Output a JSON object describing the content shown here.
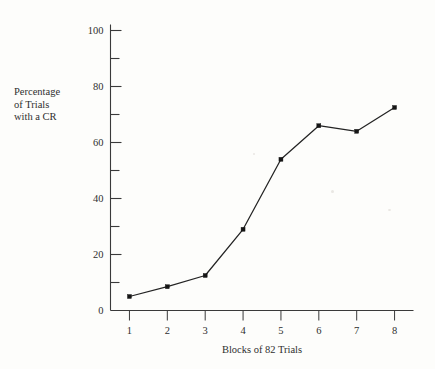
{
  "figure": {
    "background_color": "#fdfdfb",
    "line_color": "#232323",
    "axis_color": "#3a3a3a"
  },
  "ylabel_lines": [
    "Percentage",
    "of Trials",
    "with a CR"
  ],
  "chart_data": {
    "type": "line",
    "title": "",
    "xlabel": "Blocks of 82 Trials",
    "ylabel": "Percentage of Trials with a CR",
    "categories": [
      "1",
      "2",
      "3",
      "4",
      "5",
      "6",
      "7",
      "8"
    ],
    "x": [
      1,
      2,
      3,
      4,
      5,
      6,
      7,
      8
    ],
    "values": [
      5,
      8.5,
      12.5,
      29,
      54,
      66,
      64,
      72.5
    ],
    "series": [
      {
        "name": "Percentage of Trials with a CR",
        "values": [
          5,
          8.5,
          12.5,
          29,
          54,
          66,
          64,
          72.5
        ]
      }
    ],
    "xlim": [
      0.5,
      8.5
    ],
    "ylim": [
      0,
      104
    ],
    "yticks": [
      0,
      20,
      40,
      60,
      80,
      100
    ],
    "ytick_labels": [
      "0",
      "20",
      "40",
      "60",
      "80",
      "100"
    ],
    "yticks_minor": [
      10,
      30,
      50,
      70,
      90
    ],
    "xticks": [
      1,
      2,
      3,
      4,
      5,
      6,
      7,
      8
    ],
    "xtick_labels": [
      "1",
      "2",
      "3",
      "4",
      "5",
      "6",
      "7",
      "8"
    ],
    "grid": false,
    "legend": false,
    "markers": "filled-square",
    "legend_position": "none"
  }
}
